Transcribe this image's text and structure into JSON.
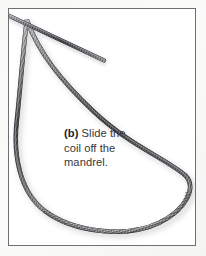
{
  "figure": {
    "kind": "photograph",
    "frame": {
      "border_color": "#6e6f70",
      "background_color": "#ffffff",
      "margin_color": "#f7f7f6"
    }
  },
  "caption": {
    "label": "(b)",
    "lines": [
      "Slide the",
      "coil off the",
      "mandrel."
    ],
    "full_text": "(b) Slide the coil off the mandrel.",
    "text_color": "#363739",
    "label_color": "#232427"
  },
  "wire": {
    "description": "helically close-wound spring wire, grey steel, shown as a large open loop that crosses itself near the upper-left corner and runs off the top edge of the frame",
    "core_color": "#2f3033",
    "highlight_color": "#b9bbbd",
    "shadow_color": "#86888b",
    "strands": [
      {
        "name": "loop-strand",
        "note": "long teardrop loop: descends from the top-left crossing, bows right to about x=190 near mid-height, sweeps across the bottom and returns up the left side"
      },
      {
        "name": "tail-strand",
        "note": "straight length running diagonally from the crossing point up and out through the top-left corner of the frame"
      }
    ],
    "crossing_point": {
      "x": 26,
      "y": 20
    }
  }
}
